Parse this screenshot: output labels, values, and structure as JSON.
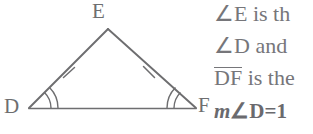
{
  "figure": {
    "shape_name": "isosceles-triangle-DEF",
    "stroke_color": "#6e6e70",
    "vertices": {
      "E": {
        "label": "E",
        "x": 108,
        "y": 29
      },
      "D": {
        "label": "D",
        "x": 29,
        "y": 108
      },
      "F": {
        "label": "F",
        "x": 196,
        "y": 108
      }
    },
    "congruent_sides": {
      "tick_count": 1,
      "marked_sides": [
        "DE",
        "EF"
      ]
    },
    "congruent_angles": {
      "arc_count": 2,
      "marked_vertices": [
        "D",
        "F"
      ]
    }
  },
  "text": {
    "line_1": "∠E is th",
    "line_2": "∠D and",
    "line_3_segment": "DF",
    "line_3_rest": " is the",
    "line_4_prefix": "m",
    "line_4_rest": "∠D=",
    "line_4_clipped": "1"
  },
  "colors": {
    "background": "#ffffff",
    "ink": "#6e6e70",
    "text": "#76767a"
  }
}
